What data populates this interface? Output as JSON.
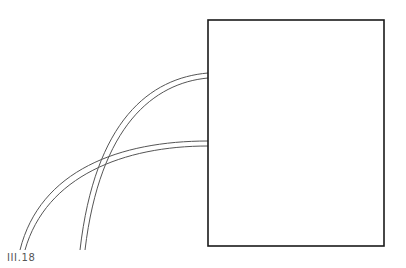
{
  "figure": {
    "label": "III.18",
    "stroke_color": "#1a1a1a",
    "curve_color": "#555555",
    "background": "#ffffff"
  },
  "shapes": {
    "rectangle": {
      "x": 208,
      "y": 20,
      "width": 176,
      "height": 226
    },
    "curves": [
      {
        "name": "upper-arc",
        "from": "box left edge y≈73-78",
        "to": "bottom x≈75-80"
      },
      {
        "name": "lower-arc",
        "from": "box left edge y≈141-146",
        "to": "bottom x≈20-25"
      }
    ]
  }
}
